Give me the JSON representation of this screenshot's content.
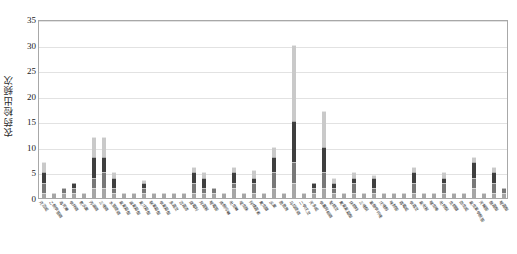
{
  "chart_data": {
    "type": "bar",
    "title": "",
    "xlabel": "",
    "ylabel": "农药检出频次",
    "ylim": [
      0,
      35
    ],
    "yticks": [
      0,
      5,
      10,
      15,
      20,
      25,
      30,
      35
    ],
    "grid": true,
    "legend": "none",
    "stacked": true,
    "bar_color_palette": [
      "#a6a6a6",
      "#787878",
      "#3f3f3f",
      "#c9c9c9",
      "#5c5c5c",
      "#8f8f8f",
      "#2b2b2b",
      "#b5b5b5"
    ],
    "categories": [
      "克百威",
      "乙酰甲胺磷",
      "毒死蜱",
      "甲拌磷",
      "氧乐果",
      "丙溴磷",
      "三唑磷",
      "水胺硫磷",
      "氯氰菊酯",
      "溴氰菊酯",
      "氰戊菊酯",
      "联苯菊酯",
      "甲氰菊酯",
      "多菌灵",
      "百菌清",
      "腐霉利",
      "异菌脲",
      "嘧霉胺",
      "烯酰吗啉",
      "吡虫啉",
      "啶虫脒",
      "阿维菌素",
      "氟虫腈",
      "乐果",
      "敌敌畏",
      "马拉硫磷",
      "二甲戊灵",
      "灭多威",
      "甲基异柳磷",
      "哒螨灵",
      "氟氯氰菊酯",
      "炔螨特",
      "三唑酮",
      "苯醚甲环唑",
      "戊唑醇",
      "咪鲜胺",
      "霜霉威",
      "甲霜灵",
      "氯吡脲",
      "噻虫嗪",
      "吡蚜酮",
      "虫螨腈",
      "茚虫威",
      "氯虫苯甲酰胺",
      "灭蝇胺",
      "醚菌酯",
      "嘧菌酯"
    ],
    "values": [
      7,
      1,
      2,
      3,
      1,
      12,
      12,
      5,
      1,
      1,
      3.5,
      1,
      1,
      1,
      1,
      6,
      5,
      2,
      1,
      6,
      1,
      5.5,
      1,
      10,
      1,
      30,
      1,
      3,
      17,
      4,
      1,
      5,
      1,
      4.5,
      1,
      1,
      1,
      6,
      1,
      1,
      5,
      1,
      1,
      8,
      1,
      6,
      2
    ],
    "series": [
      {
        "name": "样品来源1",
        "values": [
          1,
          1,
          1,
          1,
          1,
          2,
          2,
          1,
          1,
          1,
          1,
          1,
          1,
          1,
          1,
          1,
          1,
          1,
          1,
          2,
          1,
          1,
          1,
          2,
          1,
          3,
          1,
          1,
          2,
          1,
          1,
          1,
          1,
          1,
          1,
          1,
          1,
          1,
          1,
          1,
          1,
          1,
          1,
          2,
          1,
          1,
          1
        ]
      },
      {
        "name": "样品来源2",
        "values": [
          2,
          0,
          1,
          1,
          0,
          2,
          3,
          1,
          0,
          0,
          1,
          0,
          0,
          0,
          0,
          2,
          1,
          1,
          0,
          1,
          0,
          2,
          0,
          3,
          0,
          4,
          0,
          1,
          3,
          1,
          0,
          2,
          0,
          1,
          0,
          0,
          0,
          2,
          0,
          0,
          2,
          0,
          0,
          2,
          0,
          2,
          1
        ]
      },
      {
        "name": "样品来源3",
        "values": [
          2,
          0,
          0,
          1,
          0,
          4,
          3,
          2,
          0,
          0,
          1,
          0,
          0,
          0,
          0,
          2,
          2,
          0,
          0,
          2,
          0,
          1,
          0,
          3,
          0,
          8,
          0,
          1,
          5,
          1,
          0,
          1,
          0,
          2,
          0,
          0,
          0,
          2,
          0,
          0,
          1,
          0,
          0,
          3,
          0,
          2,
          0
        ]
      },
      {
        "name": "样品来源4",
        "values": [
          2,
          0,
          0,
          0,
          0,
          4,
          4,
          1,
          0,
          0,
          0.5,
          0,
          0,
          0,
          0,
          1,
          1,
          0,
          0,
          1,
          0,
          1.5,
          0,
          2,
          0,
          15,
          0,
          0,
          7,
          1,
          0,
          1,
          0,
          0.5,
          0,
          0,
          0,
          1,
          0,
          0,
          1,
          0,
          0,
          1,
          0,
          1,
          0
        ]
      }
    ]
  }
}
